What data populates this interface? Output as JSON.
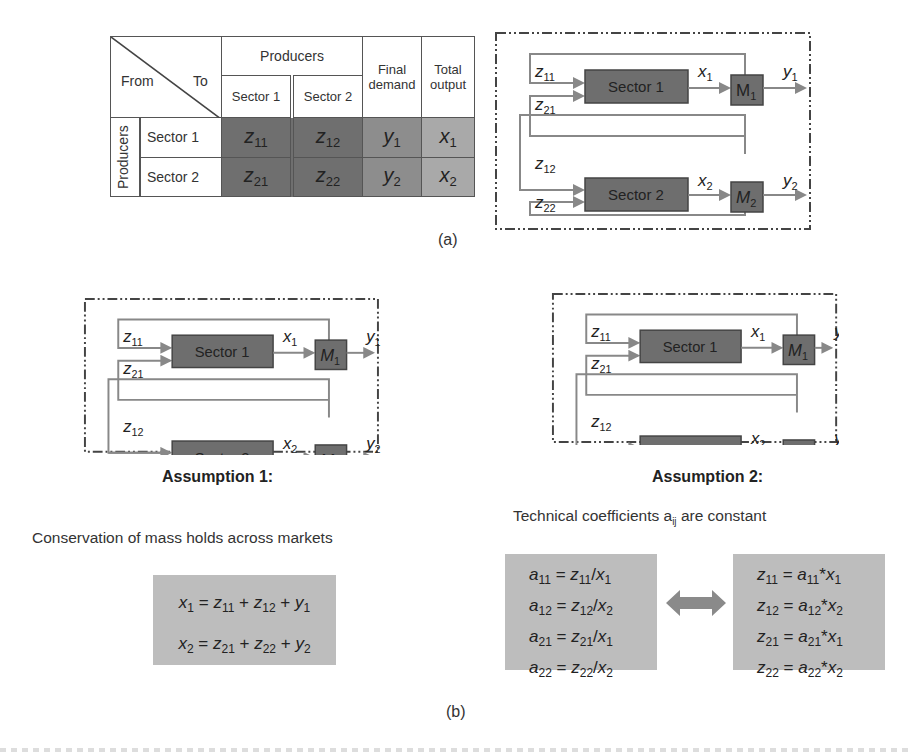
{
  "panel_a": {
    "label": "(a)",
    "table": {
      "corner_from": "From",
      "corner_to": "To",
      "producers_header": "Producers",
      "col_headers": [
        "Sector 1",
        "Sector 2"
      ],
      "final_demand_header": "Final demand",
      "total_output_header": "Total output",
      "row_group_label": "Producers",
      "rows": [
        {
          "label": "Sector 1",
          "cells": [
            {
              "v": "z",
              "s": "11"
            },
            {
              "v": "z",
              "s": "12"
            },
            {
              "v": "y",
              "s": "1"
            },
            {
              "v": "x",
              "s": "1"
            }
          ]
        },
        {
          "label": "Sector 2",
          "cells": [
            {
              "v": "z",
              "s": "21"
            },
            {
              "v": "z",
              "s": "22"
            },
            {
              "v": "y",
              "s": "2"
            },
            {
              "v": "x",
              "s": "2"
            }
          ]
        }
      ]
    }
  },
  "flow_diagram": {
    "sector1": "Sector 1",
    "sector2": "Sector 2",
    "m1": "M",
    "m1_sub": "1",
    "m2": "M",
    "m2_sub": "2",
    "z11": "z",
    "z11_sub": "11",
    "z21": "z",
    "z21_sub": "21",
    "z12": "z",
    "z12_sub": "12",
    "z22": "z",
    "z22_sub": "22",
    "x1": "x",
    "x1_sub": "1",
    "x2": "x",
    "x2_sub": "2",
    "y1": "y",
    "y1_sub": "1",
    "y2": "y",
    "y2_sub": "2"
  },
  "panel_b": {
    "label": "(b)",
    "assumption1": {
      "title": "Assumption 1:",
      "description": "Conservation of mass holds across markets",
      "equations": [
        [
          {
            "v": "x",
            "s": "1"
          },
          {
            "t": " = "
          },
          {
            "v": "z",
            "s": "11"
          },
          {
            "t": " + "
          },
          {
            "v": "z",
            "s": "12"
          },
          {
            "t": " + "
          },
          {
            "v": "y",
            "s": "1"
          }
        ],
        [
          {
            "v": "x",
            "s": "2"
          },
          {
            "t": " = "
          },
          {
            "v": "z",
            "s": "21"
          },
          {
            "t": " + "
          },
          {
            "v": "z",
            "s": "22"
          },
          {
            "t": " + "
          },
          {
            "v": "y",
            "s": "2"
          }
        ]
      ]
    },
    "assumption2": {
      "title": "Assumption 2:",
      "description_pre": "Technical coefficients a",
      "description_sub": "ij",
      "description_post": " are constant",
      "left_equations": [
        [
          {
            "v": "a",
            "s": "11"
          },
          {
            "t": " = "
          },
          {
            "v": "z",
            "s": "11"
          },
          {
            "t": "/"
          },
          {
            "v": "x",
            "s": "1"
          }
        ],
        [
          {
            "v": "a",
            "s": "12"
          },
          {
            "t": " = "
          },
          {
            "v": "z",
            "s": "12"
          },
          {
            "t": "/"
          },
          {
            "v": "x",
            "s": "2"
          }
        ],
        [
          {
            "v": "a",
            "s": "21"
          },
          {
            "t": " = "
          },
          {
            "v": "z",
            "s": "21"
          },
          {
            "t": "/"
          },
          {
            "v": "x",
            "s": "1"
          }
        ],
        [
          {
            "v": "a",
            "s": "22"
          },
          {
            "t": " = "
          },
          {
            "v": "z",
            "s": "22"
          },
          {
            "t": "/"
          },
          {
            "v": "x",
            "s": "2"
          }
        ]
      ],
      "right_equations": [
        [
          {
            "v": "z",
            "s": "11"
          },
          {
            "t": " = "
          },
          {
            "v": "a",
            "s": "11"
          },
          {
            "t": "*"
          },
          {
            "v": "x",
            "s": "1"
          }
        ],
        [
          {
            "v": "z",
            "s": "12"
          },
          {
            "t": " = "
          },
          {
            "v": "a",
            "s": "12"
          },
          {
            "t": "*"
          },
          {
            "v": "x",
            "s": "2"
          }
        ],
        [
          {
            "v": "z",
            "s": "21"
          },
          {
            "t": " = "
          },
          {
            "v": "a",
            "s": "21"
          },
          {
            "t": "*"
          },
          {
            "v": "x",
            "s": "1"
          }
        ],
        [
          {
            "v": "z",
            "s": "22"
          },
          {
            "t": " = "
          },
          {
            "v": "a",
            "s": "22"
          },
          {
            "t": "*"
          },
          {
            "v": "x",
            "s": "2"
          }
        ]
      ],
      "arrow_icon": "double-arrow-icon"
    }
  },
  "colors": {
    "dark_cell": "#6f6f6f",
    "medium_cell": "#8d8d8d",
    "light_cell": "#a9a9a9",
    "sector_box": "#6e6e6e",
    "equation_box": "#bdbdbd",
    "arrow": "#8a8a8a",
    "line": "#888888"
  }
}
